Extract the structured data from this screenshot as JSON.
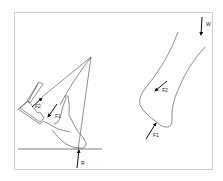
{
  "figure": {
    "left_panel": {
      "description": "Foot lifting with tool: force triangle",
      "labels": {
        "f2": "F2",
        "f1": "F1",
        "r": "R"
      }
    },
    "right_panel": {
      "description": "Bone segment free body",
      "labels": {
        "w": "W",
        "f2": "F2",
        "f1": "F1"
      }
    },
    "colors": {
      "line": "#333333",
      "arrow": "#111111",
      "frame": "#cfcfcf"
    }
  }
}
